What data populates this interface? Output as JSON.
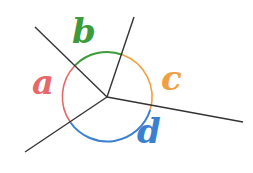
{
  "diagram": {
    "vertex": {
      "x": 107,
      "y": 97
    },
    "rays": [
      {
        "id": "ray-upper-left",
        "end": {
          "x": 35,
          "y": 27
        }
      },
      {
        "id": "ray-top",
        "end": {
          "x": 134,
          "y": 17
        }
      },
      {
        "id": "ray-right",
        "end": {
          "x": 243,
          "y": 122
        }
      },
      {
        "id": "ray-lower-left",
        "end": {
          "x": 25,
          "y": 152
        }
      }
    ],
    "angles": [
      {
        "label": "a",
        "color": "#e8686a",
        "between": [
          "ray-lower-left",
          "ray-upper-left"
        ]
      },
      {
        "label": "b",
        "color": "#3e9a3a",
        "between": [
          "ray-upper-left",
          "ray-top"
        ]
      },
      {
        "label": "c",
        "color": "#f0a040",
        "between": [
          "ray-top",
          "ray-right"
        ]
      },
      {
        "label": "d",
        "color": "#3a7fd0",
        "between": [
          "ray-right",
          "ray-lower-left"
        ]
      }
    ],
    "line_color": "#333333"
  }
}
